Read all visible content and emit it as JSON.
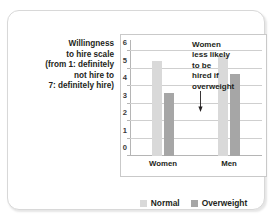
{
  "axis_caption_lines": [
    "Willingness",
    "to hire scale",
    "(from 1: definitely",
    "not hire to",
    "7: definitely hire)"
  ],
  "annotation": {
    "lines": [
      "Women",
      "less likely",
      "to be",
      "hired if",
      "overweight"
    ],
    "arrow_icon": "down-arrow-icon"
  },
  "colors": {
    "normal": "#d9d9d9",
    "overweight": "#a6a6a6",
    "grid": "#cfcfcf",
    "axis": "#b5b5b5",
    "text": "#231f20"
  },
  "chart_data": {
    "type": "bar",
    "title": "",
    "xlabel": "",
    "ylabel": "Willingness to hire scale (from 1: definitely not hire to 7: definitely hire)",
    "categories": [
      "Women",
      "Men"
    ],
    "series": [
      {
        "name": "Normal",
        "values": [
          5.45,
          5.75
        ],
        "color": "#d9d9d9"
      },
      {
        "name": "Overweight",
        "values": [
          3.6,
          4.7
        ],
        "color": "#a6a6a6"
      }
    ],
    "ylim": [
      0,
      6.4
    ],
    "yticks": [
      0,
      1,
      2,
      3,
      4,
      5,
      6
    ],
    "ytick_labels": [
      "0",
      "1",
      "2",
      "3",
      "4",
      "5",
      "6"
    ],
    "grid": true,
    "legend_position": "bottom",
    "annotations": [
      {
        "text": "Women less likely to be hired if overweight",
        "points_to": {
          "category": "Women",
          "series": "Overweight"
        }
      }
    ]
  }
}
